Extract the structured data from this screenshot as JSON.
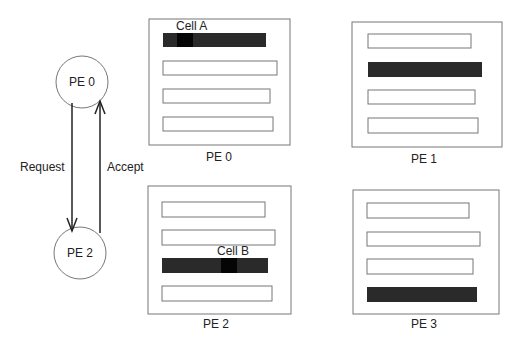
{
  "diagram": {
    "nodes": [
      {
        "id": "pe0-node",
        "label": "PE 0"
      },
      {
        "id": "pe2-node",
        "label": "PE 2"
      }
    ],
    "edges": [
      {
        "from": "PE 0",
        "to": "PE 2",
        "label": "Request"
      },
      {
        "from": "PE 2",
        "to": "PE 0",
        "label": "Accept"
      }
    ],
    "processors": [
      {
        "label": "PE 0",
        "cell_label": "Cell A",
        "filled_row": 0
      },
      {
        "label": "PE 1",
        "cell_label": "",
        "filled_row": 1
      },
      {
        "label": "PE 2",
        "cell_label": "Cell B",
        "filled_row": 2
      },
      {
        "label": "PE 3",
        "cell_label": "",
        "filled_row": 3
      }
    ]
  },
  "colors": {
    "stroke": "#555555",
    "fill": "#2a2a2a",
    "cell": "#0a0a0a"
  }
}
